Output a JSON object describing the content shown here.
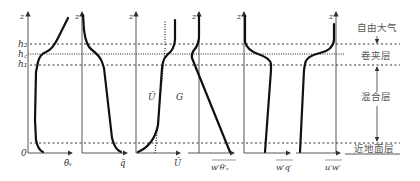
{
  "figure": {
    "height_labels": {
      "h2": "h₂",
      "hc": "h꜀",
      "h1": "h₁",
      "zero": "0"
    },
    "z_label": "z",
    "panels": [
      {
        "id": "theta",
        "x_label": "θ̄ᵥ"
      },
      {
        "id": "q",
        "x_label": "q̄"
      },
      {
        "id": "U",
        "x_label": "Ū",
        "curve_label": "Ū",
        "geostrophic_label": "G"
      },
      {
        "id": "w_theta",
        "x_label": "w′θ′ᵥ"
      },
      {
        "id": "w_q",
        "x_label": "w′q′"
      },
      {
        "id": "u_w",
        "x_label": "u′w′"
      }
    ],
    "layers": {
      "free_atmosphere": "自由大气",
      "entrainment_zone": "卷夹层",
      "mixed_layer": "混合层",
      "surface_layer": "近地面层"
    }
  }
}
